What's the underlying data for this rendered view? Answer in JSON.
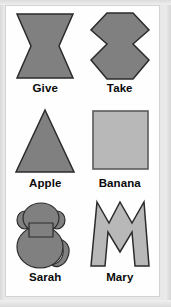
{
  "card": {
    "background_color": "#e8e8e8",
    "panel_color": "#fefefe",
    "panel_border_color": "#d2d2d2"
  },
  "palette": {
    "dark_gray_fill": "#808080",
    "light_gray_fill": "#b8b8b8",
    "outline_color": "#2b2b2b",
    "label_color": "#0a0a0a"
  },
  "items": [
    {
      "id": "give",
      "label": "Give",
      "shape": "bowtie-hourglass",
      "fill": "#808080",
      "stroke": "#2b2b2b",
      "description": "horizontal bowtie / hourglass pinched at the middle"
    },
    {
      "id": "take",
      "label": "Take",
      "shape": "double-arrow-hexagon",
      "fill": "#808080",
      "stroke": "#2b2b2b",
      "description": "vertical hexagon with inward notches on left and right"
    },
    {
      "id": "apple",
      "label": "Apple",
      "shape": "triangle",
      "fill": "#808080",
      "stroke": "#2b2b2b",
      "description": "equilateral triangle pointing up"
    },
    {
      "id": "banana",
      "label": "Banana",
      "shape": "square",
      "fill": "#b8b8b8",
      "stroke": "#5a5a5a",
      "description": "light gray square with dark outline"
    },
    {
      "id": "sarah",
      "label": "Sarah",
      "shape": "monkey-silhouette",
      "fill": "#808080",
      "stroke": "#2b2b2b",
      "description": "monkey seen from behind with round ears and curled tail"
    },
    {
      "id": "mary",
      "label": "Mary",
      "shape": "letter-m",
      "fill": "#b8b8b8",
      "stroke": "#2b2b2b",
      "description": "jagged letter M outline in light gray"
    }
  ]
}
